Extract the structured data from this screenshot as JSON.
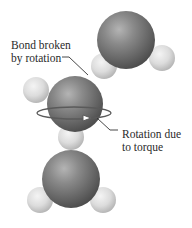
{
  "diagram": {
    "labels": {
      "bond_broken": {
        "line1": "Bond broken",
        "line2": "by rotation"
      },
      "rotation_due": {
        "line1": "Rotation due",
        "line2": "to torque"
      }
    },
    "molecules": [
      {
        "name": "top-water-molecule",
        "atoms": [
          "oxygen",
          "hydrogen",
          "hydrogen"
        ]
      },
      {
        "name": "middle-water-molecule",
        "atoms": [
          "oxygen",
          "hydrogen",
          "hydrogen"
        ]
      },
      {
        "name": "bottom-water-molecule",
        "atoms": [
          "oxygen",
          "hydrogen",
          "hydrogen"
        ]
      }
    ],
    "colors": {
      "oxygen": "#6e6e6e",
      "hydrogen": "#d8d8d8",
      "leader_line": "#333333",
      "rotation_arrow": "#555555"
    }
  }
}
